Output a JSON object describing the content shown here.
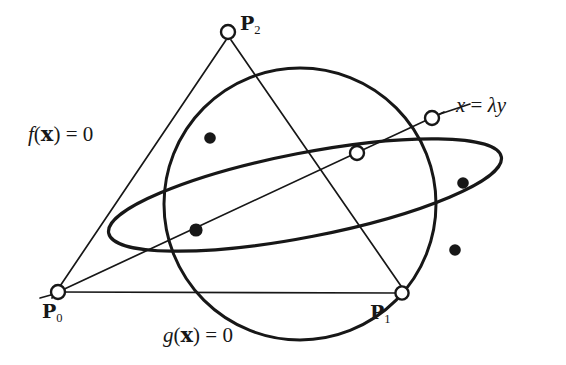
{
  "figure": {
    "background_color": "#ffffff",
    "stroke_color": "#171717",
    "width": 566,
    "height": 365
  },
  "labels": {
    "f_curve": {
      "text": "f(x) = 0",
      "fn": "f",
      "arg": "x",
      "rel": "=",
      "value": "0"
    },
    "g_curve": {
      "text": "g(x) = 0",
      "fn": "g",
      "arg": "x",
      "rel": "=",
      "value": "0"
    },
    "line_x": {
      "text": "x = λy",
      "lhs": "x",
      "rel": "=",
      "rhs_scalar": "λ",
      "rhs_var": "y"
    },
    "p0": {
      "text": "P0",
      "base": "P",
      "sub": "0"
    },
    "p1": {
      "text": "P1",
      "base": "P",
      "sub": "1"
    },
    "p2": {
      "text": "P2",
      "base": "P",
      "sub": "2"
    }
  },
  "geometry": {
    "conic_f": {
      "name": "ellipse",
      "center": [
        305,
        195
      ],
      "rx": 200,
      "ry": 42,
      "rotation_deg": 11,
      "stroke_width": 3.2
    },
    "conic_g": {
      "name": "circle",
      "center": [
        300,
        204
      ],
      "r": 136,
      "stroke_width": 3.0
    },
    "triangle": {
      "vertices": {
        "p0": [
          58,
          292
        ],
        "p1": [
          402,
          293
        ],
        "p2": [
          228,
          32
        ]
      },
      "stroke_width": 1.6
    },
    "secant_line": {
      "from": [
        58,
        292
      ],
      "to": [
        489,
        107
      ],
      "stroke_width": 1.6
    },
    "leader_line": {
      "from": [
        440,
        114
      ],
      "to": [
        468,
        105
      ],
      "stroke_width": 1.6
    },
    "open_nodes": [
      {
        "name": "vertex-p0",
        "cx": 58,
        "cy": 292,
        "r": 7.0
      },
      {
        "name": "vertex-p1",
        "cx": 402,
        "cy": 293,
        "r": 6.5
      },
      {
        "name": "vertex-p2",
        "cx": 228,
        "cy": 32,
        "r": 7.0
      },
      {
        "name": "line-conic-inner",
        "cx": 357,
        "cy": 153,
        "r": 7.0
      },
      {
        "name": "line-conic-outer",
        "cx": 432,
        "cy": 118,
        "r": 7.0
      }
    ],
    "filled_nodes": [
      {
        "name": "intersection-upper-left",
        "cx": 210,
        "cy": 138,
        "r": 5.6
      },
      {
        "name": "intersection-lower-left",
        "cx": 196,
        "cy": 230,
        "r": 6.4
      },
      {
        "name": "intersection-upper-right",
        "cx": 463,
        "cy": 183,
        "r": 5.6
      },
      {
        "name": "intersection-lower-right",
        "cx": 455,
        "cy": 250,
        "r": 5.6
      }
    ]
  }
}
